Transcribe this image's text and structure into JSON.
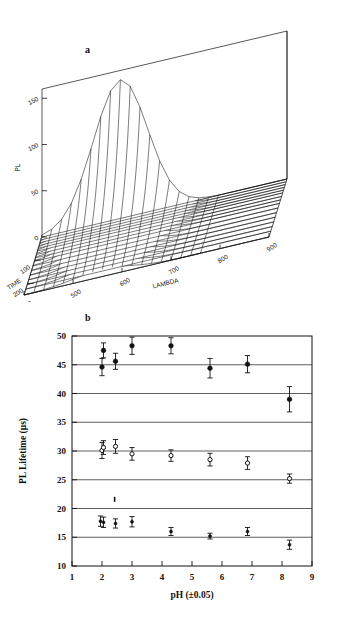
{
  "figure": {
    "panel_a_label": "a",
    "panel_b_label": "b"
  },
  "chart_data": [
    {
      "id": "panel-a",
      "type": "surface",
      "title": "",
      "panel_label": "a",
      "xlabel": "LAMBDA",
      "ylabel": "TIME",
      "zlabel": "PL",
      "xticks": [
        400,
        500,
        600,
        700,
        800,
        900
      ],
      "yticks": [
        100,
        200
      ],
      "zticks": [
        0,
        50,
        100,
        150
      ],
      "xlim": [
        400,
        900
      ],
      "ylim": [
        0,
        250
      ],
      "zlim": [
        0,
        160
      ],
      "grid": false,
      "legend": "none",
      "description": "Three-dimensional wireframe mesh of photoluminescence intensity PL versus emission wavelength LAMBDA and decay TIME. A single emission band peaks near LAMBDA 560 nm at early TIME with PL near 150, decaying monotonically toward zero at long TIME and flat baseline beyond 750 nm.",
      "surface": {
        "lambda_samples": [
          400,
          420,
          440,
          460,
          480,
          500,
          520,
          540,
          560,
          580,
          600,
          620,
          640,
          660,
          680,
          700,
          720,
          740,
          760,
          800,
          850,
          900
        ],
        "time_samples": [
          0,
          12,
          24,
          36,
          48,
          60,
          75,
          90,
          105,
          125,
          145,
          165,
          185,
          205,
          225,
          250
        ],
        "peak_lambda": 560,
        "peak_pl": 150,
        "lambda_width": 78,
        "decay_constant": 85
      }
    },
    {
      "id": "panel-b",
      "type": "scatter",
      "title": "",
      "panel_label": "b",
      "xlabel": "pH (±0.05)",
      "ylabel": "PL Lifetime (μs)",
      "xlim": [
        1,
        9
      ],
      "ylim": [
        10,
        50
      ],
      "xticks": [
        1,
        2,
        3,
        4,
        5,
        6,
        7,
        8,
        9
      ],
      "yticks": [
        10,
        15,
        20,
        25,
        30,
        35,
        40,
        45,
        50
      ],
      "grid": true,
      "gridlines_y": [
        15,
        20,
        25,
        30,
        35,
        40,
        45
      ],
      "legend": "none",
      "series": [
        {
          "name": "long-lifetime component",
          "marker": "filled-circle",
          "marker_size": 4.6,
          "x": [
            2.0,
            2.05,
            2.45,
            3.0,
            4.3,
            5.6,
            6.85,
            8.25
          ],
          "y": [
            44.6,
            47.5,
            45.6,
            48.3,
            48.3,
            44.4,
            45.1,
            39.0
          ],
          "yerr": [
            1.5,
            1.3,
            1.4,
            1.5,
            1.4,
            1.7,
            1.5,
            2.2
          ]
        },
        {
          "name": "intermediate-lifetime component",
          "marker": "open-circle",
          "marker_size": 4.2,
          "x": [
            2.0,
            2.05,
            2.45,
            3.0,
            4.3,
            5.6,
            6.85,
            8.25
          ],
          "y": [
            30.1,
            30.6,
            30.8,
            29.5,
            29.2,
            28.5,
            27.9,
            25.2
          ],
          "yerr": [
            1.4,
            1.2,
            1.2,
            1.1,
            1.0,
            1.1,
            1.1,
            0.8
          ]
        },
        {
          "name": "short-lifetime component",
          "marker": "filled-circle-small",
          "marker_size": 3.0,
          "x": [
            1.95,
            2.05,
            2.45,
            3.0,
            4.3,
            5.6,
            6.85,
            8.25
          ],
          "y": [
            17.8,
            17.6,
            17.4,
            17.7,
            16.0,
            15.2,
            16.0,
            13.7
          ],
          "yerr": [
            0.9,
            0.9,
            0.8,
            0.9,
            0.7,
            0.5,
            0.7,
            0.8
          ]
        }
      ],
      "artifacts": [
        {
          "name": "stray-mark",
          "x": 2.42,
          "y": 21.5
        }
      ]
    }
  ]
}
